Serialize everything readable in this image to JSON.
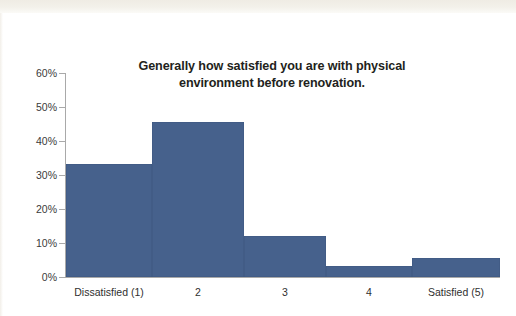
{
  "chart_data": {
    "type": "bar",
    "title": "Generally how satisfied you are with physical environment before renovation.",
    "title_line1": "Generally how satisfied you are with physical",
    "title_line2": "environment before renovation.",
    "categories": [
      "Dissatisfied (1)",
      "2",
      "3",
      "4",
      "Satisfied (5)"
    ],
    "values": [
      33.3,
      45.6,
      12.1,
      3.2,
      5.6
    ],
    "value_labels": [
      "33.3%",
      "45.6%",
      "12.1%",
      "3.2%",
      "5.6%"
    ],
    "xlabel": "",
    "ylabel": "",
    "ylim": [
      0,
      60
    ],
    "ytick_values": [
      60,
      50,
      40,
      30,
      20,
      10,
      0
    ],
    "ytick_labels": [
      "60%",
      "50%",
      "40%",
      "30%",
      "20%",
      "10%",
      "0%"
    ],
    "grid": false,
    "legend": false,
    "legend_position": "none",
    "bar_gap": 0,
    "series": [
      {
        "name": "Satisfaction before renovation",
        "values": [
          33.3,
          45.6,
          12.1,
          3.2,
          5.6
        ]
      }
    ],
    "bar_widths_px": [
      86,
      92,
      82,
      86,
      88
    ],
    "colors": {
      "bar": "#46618C",
      "axis": "#A9A9A9",
      "text": "#231F20",
      "tick_text": "#3A3A3A",
      "background": "#FFFFFF",
      "scan_band": "#EFECE4"
    }
  }
}
